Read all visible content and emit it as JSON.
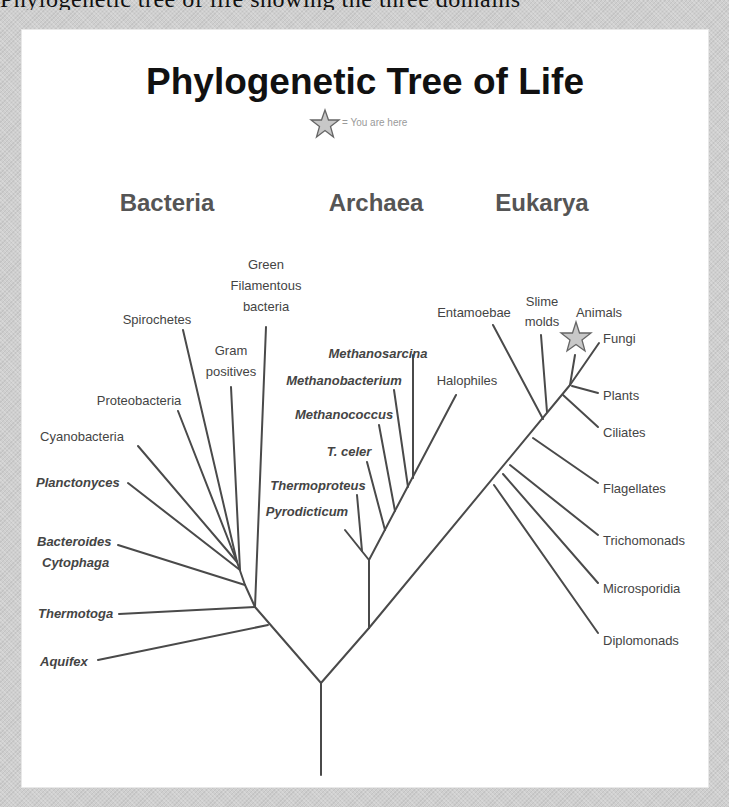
{
  "page": {
    "clipped_text_above": "Phylogenetic tree of life showing the three domains"
  },
  "diagram": {
    "title": "Phylogenetic Tree of Life",
    "legend": {
      "icon": "star-icon",
      "text": "= You are here"
    },
    "domains": [
      {
        "name": "Bacteria"
      },
      {
        "name": "Archaea"
      },
      {
        "name": "Eukarya"
      }
    ],
    "bacteria": {
      "green_filamentous": [
        "Green",
        "Filamentous",
        "bacteria"
      ],
      "spirochetes": "Spirochetes",
      "gram_positives": [
        "Gram",
        "positives"
      ],
      "proteobacteria": "Proteobacteria",
      "cyanobacteria": "Cyanobacteria",
      "planctomyces": "Planctonyces",
      "bacteroides": [
        "Bacteroides",
        "Cytophaga"
      ],
      "thermotoga": "Thermotoga",
      "aquifex": "Aquifex"
    },
    "archaea": {
      "methanosarcina": "Methanosarcina",
      "methanobacterium": "Methanobacterium",
      "methanococcus": "Methanococcus",
      "t_celer": "T. celer",
      "thermoproteus": "Thermoproteus",
      "pyrodicticum": "Pyrodicticum",
      "halophiles": "Halophiles"
    },
    "eukarya": {
      "entamoebae": "Entamoebae",
      "slime_molds": [
        "Slime",
        "molds"
      ],
      "animals": "Animals",
      "fungi": "Fungi",
      "plants": "Plants",
      "ciliates": "Ciliates",
      "flagellates": "Flagellates",
      "trichomonads": "Trichomonads",
      "microsporidia": "Microsporidia",
      "diplomonads": "Diplomonads"
    },
    "you_are_here": "Animals",
    "colors": {
      "background": "#cfcfcf",
      "panel": "#ffffff",
      "title": "#111111",
      "domain_heading": "#555555",
      "label": "#444444",
      "branch": "#4a4a4a",
      "star_fill": "#c8c8c8",
      "star_stroke": "#666666",
      "legend_text": "#9a9a9a"
    }
  }
}
